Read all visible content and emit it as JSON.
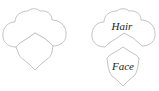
{
  "figures": [
    {
      "name": "combined-head",
      "description": "hair and face outline combined"
    },
    {
      "name": "separated-head",
      "labels": {
        "hair": "Hair",
        "face": "Face"
      }
    }
  ],
  "colors": {
    "outline": "#c4c4c4",
    "text": "#222222",
    "background": "#ffffff"
  }
}
